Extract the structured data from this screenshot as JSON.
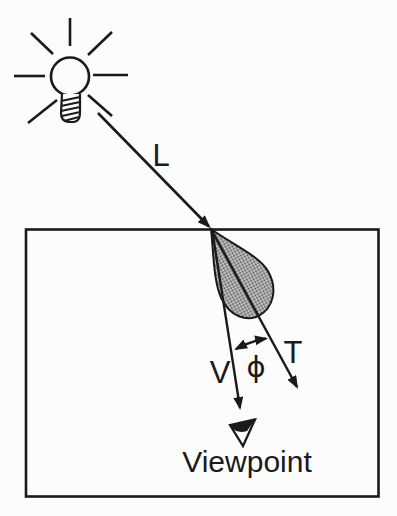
{
  "figure": {
    "labels": {
      "light_ray": "L",
      "view_vector": "V",
      "transmitted_vector": "T",
      "angle": "ϕ",
      "viewpoint": "Viewpoint"
    },
    "icons": {
      "light_source": "light-bulb-icon",
      "viewer": "eye-icon",
      "arrowheads": "arrow-icon"
    },
    "colors": {
      "ink": "#1a1a1a",
      "background": "#fcfcfc",
      "lobe_halftone_base": "#c9c9c9",
      "lobe_halftone_dot": "#4a4a4a"
    }
  }
}
